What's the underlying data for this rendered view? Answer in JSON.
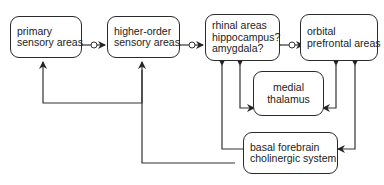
{
  "diagram": {
    "nodes": {
      "primary": {
        "line1": "primary",
        "line2": "sensory areas"
      },
      "higher": {
        "line1": "higher-order",
        "line2": "sensory areas"
      },
      "rhinal": {
        "line1": "rhinal areas",
        "line2": "hippocampus?",
        "line3": "amygdala?"
      },
      "orbital": {
        "line1": "orbital",
        "line2": "prefrontal areas"
      },
      "thalamus": {
        "line1": "medial",
        "line2": "thalamus"
      },
      "basal": {
        "line1": "basal forebrain",
        "line2": "cholinergic system"
      }
    },
    "edges": [
      {
        "from": "primary",
        "to": "higher",
        "type": "bidirectional"
      },
      {
        "from": "higher",
        "to": "rhinal",
        "type": "bidirectional"
      },
      {
        "from": "rhinal",
        "to": "orbital",
        "type": "bidirectional"
      },
      {
        "from": "thalamus",
        "to": "rhinal",
        "type": "bidirectional"
      },
      {
        "from": "thalamus",
        "to": "orbital",
        "type": "bidirectional"
      },
      {
        "from": "basal",
        "to": "primary",
        "type": "directed"
      },
      {
        "from": "basal",
        "to": "higher",
        "type": "directed"
      },
      {
        "from": "rhinal",
        "to": "basal",
        "type": "bidirectional"
      },
      {
        "from": "orbital",
        "to": "basal",
        "type": "bidirectional"
      }
    ]
  }
}
